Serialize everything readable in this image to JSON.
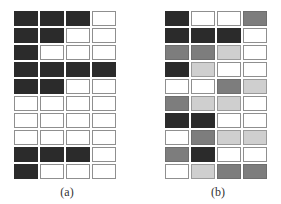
{
  "figures": [
    {
      "id": "a",
      "caption": "(a)",
      "rows": 10,
      "cols": 4,
      "cells": [
        [
          "D",
          "D",
          "D",
          "W"
        ],
        [
          "D",
          "D",
          "W",
          "W"
        ],
        [
          "D",
          "W",
          "W",
          "W"
        ],
        [
          "D",
          "D",
          "D",
          "D"
        ],
        [
          "D",
          "D",
          "W",
          "W"
        ],
        [
          "W",
          "W",
          "W",
          "W"
        ],
        [
          "W",
          "W",
          "W",
          "W"
        ],
        [
          "W",
          "W",
          "W",
          "W"
        ],
        [
          "D",
          "D",
          "D",
          "W"
        ],
        [
          "D",
          "W",
          "W",
          "W"
        ]
      ]
    },
    {
      "id": "b",
      "caption": "(b)",
      "rows": 10,
      "cols": 4,
      "cells": [
        [
          "D",
          "W",
          "W",
          "M"
        ],
        [
          "D",
          "D",
          "D",
          "W"
        ],
        [
          "M",
          "M",
          "L",
          "W"
        ],
        [
          "D",
          "L",
          "W",
          "W"
        ],
        [
          "W",
          "W",
          "M",
          "L"
        ],
        [
          "M",
          "L",
          "L",
          "W"
        ],
        [
          "D",
          "D",
          "W",
          "W"
        ],
        [
          "W",
          "M",
          "L",
          "L"
        ],
        [
          "M",
          "D",
          "W",
          "W"
        ],
        [
          "W",
          "L",
          "M",
          "M"
        ]
      ]
    }
  ],
  "legend_shades": {
    "D": "#2b2b2b",
    "M": "#7d7d7d",
    "L": "#cfcfcf",
    "W": "#ffffff"
  }
}
